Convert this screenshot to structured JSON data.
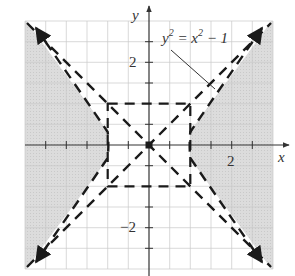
{
  "figure": {
    "axes": {
      "x_label": "x",
      "y_label": "y",
      "x_tick_label": "2",
      "y_tick_label_pos": "2",
      "y_tick_label_neg": "−2",
      "range": [
        -3,
        3
      ],
      "tick_step": 0.5
    },
    "equation_label": {
      "base1": "y",
      "sup1": "2",
      "mid": " = x",
      "sup2": "2",
      "tail": " − 1"
    },
    "elements": {
      "hyperbola": "y^2 = x^2 - 1 (dashed, with arrowheads)",
      "asymptotes": [
        "y = x",
        "y = -x"
      ],
      "fundamental_rectangle": {
        "x": [
          -1,
          1
        ],
        "y": [
          -1,
          1
        ]
      },
      "shaded_region": "x^2 - y^2 >= 1"
    },
    "colors": {
      "shade": "#d9d9d9",
      "grid": "#c8c8c8",
      "axis": "#333333",
      "curve": "#1a1a1a"
    }
  }
}
